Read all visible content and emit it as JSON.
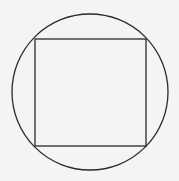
{
  "diagram": {
    "colors": {
      "background": "#f4f4f2",
      "stroke": "#2a2a2a"
    },
    "circle": {
      "cx": 90,
      "cy": 92,
      "r": 78
    },
    "square": {
      "x": 35,
      "y": 39,
      "width": 111,
      "height": 107
    }
  }
}
